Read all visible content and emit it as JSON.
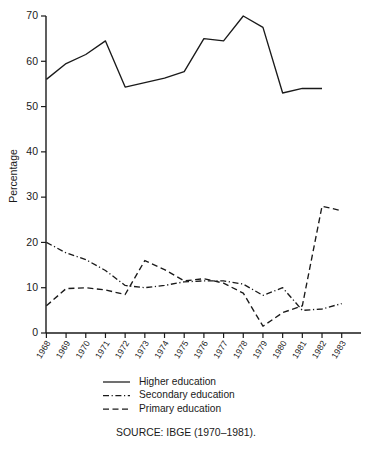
{
  "chart_data": {
    "type": "line",
    "title": "",
    "xlabel": "",
    "ylabel": "Percentage",
    "ylim": [
      0,
      70
    ],
    "ytick_values": [
      0,
      10,
      20,
      30,
      40,
      50,
      60,
      70
    ],
    "ytick_labels": [
      "0",
      "10",
      "20",
      "30",
      "40",
      "50",
      "60",
      "70"
    ],
    "grid": false,
    "legend_position": "below-axes",
    "categories": [
      "1968",
      "1969",
      "1970",
      "1971",
      "1972",
      "1973",
      "1974",
      "1975",
      "1976",
      "1977",
      "1978",
      "1979",
      "1980",
      "1981",
      "1982",
      "1983"
    ],
    "series": [
      {
        "name": "Higher education",
        "style": "solid",
        "values": [
          56,
          59.5,
          61.5,
          64.5,
          54.3,
          55.3,
          56.3,
          57.7,
          65,
          64.5,
          70,
          67.5,
          53,
          54,
          54,
          null
        ]
      },
      {
        "name": "Secondary education",
        "style": "dash-dot",
        "values": [
          20,
          17.7,
          16.2,
          13.8,
          10.5,
          10,
          10.5,
          11.3,
          11.5,
          11.5,
          10.8,
          8.3,
          10,
          5,
          5.3,
          6.5
        ]
      },
      {
        "name": "Primary education",
        "style": "dashed",
        "values": [
          6,
          9.8,
          10,
          9.5,
          8.5,
          16,
          14,
          11.5,
          12,
          11,
          8.8,
          1.5,
          4.5,
          6,
          28,
          27
        ]
      }
    ],
    "annotations": []
  },
  "legend": {
    "entries": [
      {
        "label": "Higher education",
        "style": "solid"
      },
      {
        "label": "Secondary education",
        "style": "dash-dot"
      },
      {
        "label": "Primary education",
        "style": "dashed"
      }
    ]
  },
  "source": {
    "text": "SOURCE: IBGE (1970–1981)."
  }
}
